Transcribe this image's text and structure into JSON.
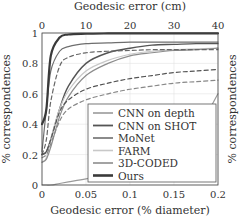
{
  "chart_data": {
    "type": "line",
    "title": "",
    "xlabel": "Geodesic error (% diameter)",
    "xlabel_top": "Geodesic error (cm)",
    "ylabel": "% correspondences",
    "xlim": [
      0,
      0.2
    ],
    "xlim_top": [
      0,
      40
    ],
    "ylim": [
      0,
      1
    ],
    "xticks": [
      "0",
      "0.05",
      "0.1",
      "0.15",
      "0.2"
    ],
    "xticks_top": [
      "0",
      "10",
      "20",
      "30",
      "40"
    ],
    "yticks": [
      "0",
      "0.2",
      "0.4",
      "0.6",
      "0.8",
      "1"
    ],
    "grid": true,
    "legend_position": "lower right",
    "x": [
      0,
      0.005,
      0.01,
      0.02,
      0.03,
      0.05,
      0.075,
      0.1,
      0.125,
      0.15,
      0.175,
      0.2
    ],
    "series": [
      {
        "name": "CNN on depth",
        "color": "#9a9a9a",
        "style": "solid",
        "width": 1.2,
        "values": [
          0.0,
          0.0,
          0.0,
          0.01,
          0.02,
          0.04,
          0.07,
          0.1,
          0.15,
          0.22,
          0.35,
          0.6
        ]
      },
      {
        "name": "CNN on SHOT",
        "color": "#555555",
        "style": "solid",
        "width": 1.4,
        "values": [
          0.2,
          0.22,
          0.3,
          0.5,
          0.65,
          0.8,
          0.87,
          0.9,
          0.92,
          0.925,
          0.93,
          0.93
        ]
      },
      {
        "name": "MoNet",
        "color": "#6e6e6e",
        "style": "solid",
        "width": 1.2,
        "values": [
          0.22,
          0.5,
          0.75,
          0.88,
          0.91,
          0.93,
          0.935,
          0.94,
          0.94,
          0.94,
          0.94,
          0.94
        ]
      },
      {
        "name": "FARM",
        "color": "#c8c8c8",
        "style": "solid",
        "width": 1.2,
        "values": [
          0.15,
          0.18,
          0.3,
          0.5,
          0.62,
          0.75,
          0.82,
          0.86,
          0.88,
          0.89,
          0.895,
          0.9
        ]
      },
      {
        "name": "3D-CODED",
        "color": "#8c8c8c",
        "style": "solid",
        "width": 1.2,
        "values": [
          0.15,
          0.17,
          0.25,
          0.45,
          0.58,
          0.72,
          0.8,
          0.85,
          0.87,
          0.885,
          0.89,
          0.9
        ]
      },
      {
        "name": "Ours",
        "color": "#3a3a3a",
        "style": "solid",
        "width": 2.2,
        "values": [
          0.4,
          0.5,
          0.85,
          0.97,
          0.99,
          0.995,
          0.997,
          0.998,
          0.998,
          0.998,
          0.998,
          0.998
        ]
      },
      {
        "name": "dashed-1",
        "color": "#666666",
        "style": "dashed",
        "width": 1.2,
        "values": [
          0.2,
          0.3,
          0.55,
          0.78,
          0.84,
          0.87,
          0.88,
          0.885,
          0.89,
          0.89,
          0.89,
          0.89
        ]
      },
      {
        "name": "dashed-2",
        "color": "#555555",
        "style": "dashed",
        "width": 1.2,
        "values": [
          0.2,
          0.22,
          0.3,
          0.48,
          0.56,
          0.63,
          0.67,
          0.7,
          0.72,
          0.74,
          0.75,
          0.76
        ]
      },
      {
        "name": "dashed-3",
        "color": "#888888",
        "style": "dashed",
        "width": 1.2,
        "values": [
          0.18,
          0.2,
          0.27,
          0.42,
          0.5,
          0.56,
          0.6,
          0.63,
          0.65,
          0.67,
          0.68,
          0.69
        ]
      }
    ]
  },
  "legend": {
    "items": [
      {
        "label": "CNN on depth",
        "color": "#9a9a9a",
        "width": 1.2
      },
      {
        "label": "CNN on SHOT",
        "color": "#555555",
        "width": 1.4
      },
      {
        "label": "MoNet",
        "color": "#6e6e6e",
        "width": 1.2
      },
      {
        "label": "FARM",
        "color": "#c8c8c8",
        "width": 1.2
      },
      {
        "label": "3D-CODED",
        "color": "#8c8c8c",
        "width": 1.2
      },
      {
        "label": "Ours",
        "color": "#3a3a3a",
        "width": 2.2
      }
    ]
  },
  "right_partial_label": "% correspondences"
}
